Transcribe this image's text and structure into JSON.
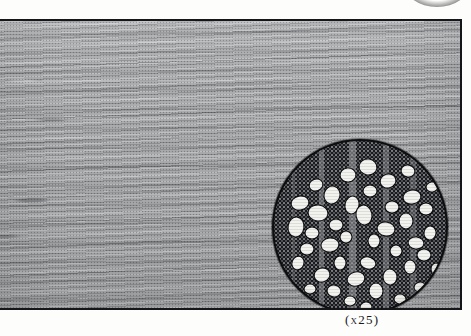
{
  "figure": {
    "name": "wood-specimen-plate",
    "caption": "(x25)",
    "magnification": "x25",
    "panel": {
      "name": "wood-grain-photograph",
      "description": "Longitudinal wood grain surface photograph, greyscale halftone",
      "border_color": "#15161a",
      "base_color": "#a9aaac"
    },
    "inset": {
      "name": "microscope-cross-section",
      "description": "Circular magnified transverse section showing vessels, fibres and rays",
      "shape": "circle",
      "rim_color": "#0d0e10",
      "matrix_color": "#1a1b1f",
      "vessel_color": "#f2f2ee",
      "ray_color": "#9a9b9f"
    },
    "top_arc": {
      "name": "cut-off-arc",
      "description": "Faint dark arc bleeding in from top edge"
    }
  },
  "colors": {
    "page_background": "#fdfdfc",
    "ink": "#19191c"
  }
}
